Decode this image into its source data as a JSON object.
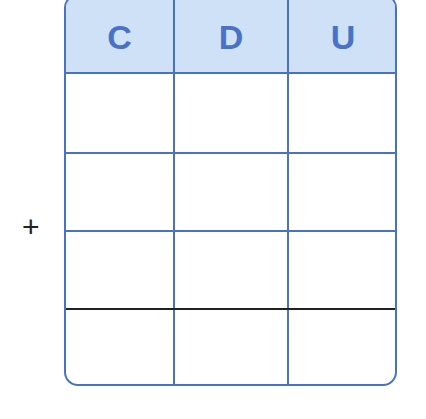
{
  "operator": "+",
  "columns": [
    {
      "label": "C"
    },
    {
      "label": "D"
    },
    {
      "label": "U"
    }
  ],
  "rows": [
    [
      "",
      "",
      ""
    ],
    [
      "",
      "",
      ""
    ],
    [
      "",
      "",
      ""
    ],
    [
      "",
      "",
      ""
    ]
  ],
  "colors": {
    "border": "#4a72c4",
    "header_bg": "#cfe1f7",
    "header_text": "#4a72c4",
    "sum_line": "#222222"
  }
}
